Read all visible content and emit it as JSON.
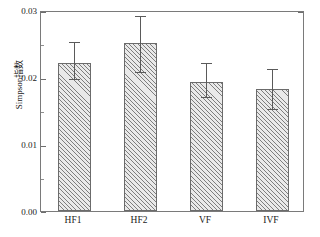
{
  "chart_data": {
    "type": "bar",
    "title": "",
    "xlabel": "",
    "ylabel": "Simpson指数",
    "categories": [
      "HF1",
      "HF2",
      "VF",
      "IVF"
    ],
    "values": [
      0.0222,
      0.0252,
      0.0194,
      0.0183
    ],
    "errors_upper": [
      0.0255,
      0.0294,
      0.0224,
      0.0215
    ],
    "errors_lower": [
      0.0199,
      0.021,
      0.0173,
      0.0155
    ],
    "error_up": [
      0.0033,
      0.0042,
      0.003,
      0.0032
    ],
    "error_down": [
      0.0023,
      0.0042,
      0.0021,
      0.0028
    ],
    "ylim": [
      0.0,
      0.03
    ],
    "ytick_labels": [
      "0.00",
      "0.01",
      "0.02",
      "0.03"
    ],
    "ytick_values": [
      0.0,
      0.01,
      0.02,
      0.03
    ],
    "yminor_values": [
      0.005,
      0.015,
      0.025
    ],
    "grid": false,
    "legend": "none",
    "bar_fill": "#e9e9e9",
    "bar_hatch": "diagonal-45",
    "bar_edge_color": "#6b6b6b",
    "frame_color": "#7a7a7a",
    "error_color": "#5a5a5a"
  },
  "axis": {
    "y_label_0": "0.00",
    "y_label_1": "0.01",
    "y_label_2": "0.02",
    "y_label_3": "0.03",
    "y_title": "Simpson指数",
    "x_label_0": "HF1",
    "x_label_1": "HF2",
    "x_label_2": "VF",
    "x_label_3": "IVF"
  }
}
